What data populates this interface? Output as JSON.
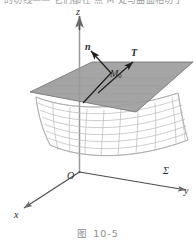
{
  "page": {
    "top_cut_text": "的切线—— 它们都在 点 M 处与曲面相切于",
    "width": 196,
    "height": 246
  },
  "caption": {
    "figure_word": "图",
    "number": "10-5"
  },
  "figure": {
    "axes": {
      "z_label": "z",
      "y_label": "y",
      "x_label": "x",
      "origin_label": "O"
    },
    "surface": {
      "label": "Σ",
      "description": "saddle-shaped mesh surface"
    },
    "tangent_plane": {
      "description": "shaded gray parallelogram tangent plane"
    },
    "vectors": {
      "normal_label": "n",
      "tangent_label": "T",
      "point_label": "M",
      "point_subscript": "0"
    },
    "colors": {
      "plane_fill": "#9d9d9d",
      "plane_edge": "#6f6f6f",
      "mesh_line": "#b9b9b9",
      "axis_line": "#8a8a8a",
      "vector_line": "#1f1f1f",
      "text": "#2b2b2b",
      "caption_text": "#8d8d8d",
      "background": "#ffffff"
    }
  }
}
